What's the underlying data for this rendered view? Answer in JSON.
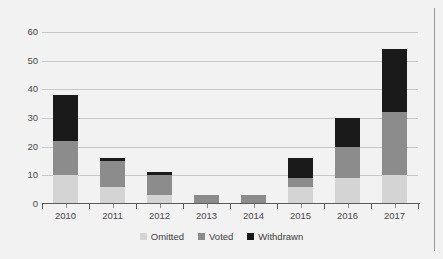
{
  "chart_data": {
    "type": "bar",
    "subtype": "stacked-bar",
    "title": "",
    "xlabel": "",
    "ylabel": "",
    "categories": [
      "2010",
      "2011",
      "2012",
      "2013",
      "2014",
      "2015",
      "2016",
      "2017"
    ],
    "series": [
      {
        "name": "Omitted",
        "color": "#d4d4d4",
        "values": [
          10,
          6,
          3,
          0,
          0,
          6,
          9,
          10
        ]
      },
      {
        "name": "Voted",
        "color": "#8c8c8c",
        "values": [
          12,
          9,
          7,
          3,
          3,
          3,
          11,
          22
        ]
      },
      {
        "name": "Withdrawn",
        "color": "#1a1a1a",
        "values": [
          16,
          1,
          1,
          0,
          0,
          7,
          10,
          22
        ]
      }
    ],
    "totals": [
      38,
      16,
      11,
      3,
      3,
      16,
      30,
      54
    ],
    "ylim": [
      0,
      60
    ],
    "yticks": [
      0,
      10,
      20,
      30,
      40,
      50,
      60
    ],
    "ytick_labels": [
      "0",
      "10",
      "20",
      "30",
      "40",
      "50",
      "60"
    ],
    "grid": true,
    "grid_axis": "y",
    "legend_position": "bottom",
    "plot_background": "#f2f2f2"
  },
  "legend": {
    "items": [
      {
        "label": "Omitted",
        "color": "#d4d4d4"
      },
      {
        "label": "Voted",
        "color": "#8c8c8c"
      },
      {
        "label": "Withdrawn",
        "color": "#1a1a1a"
      }
    ]
  }
}
